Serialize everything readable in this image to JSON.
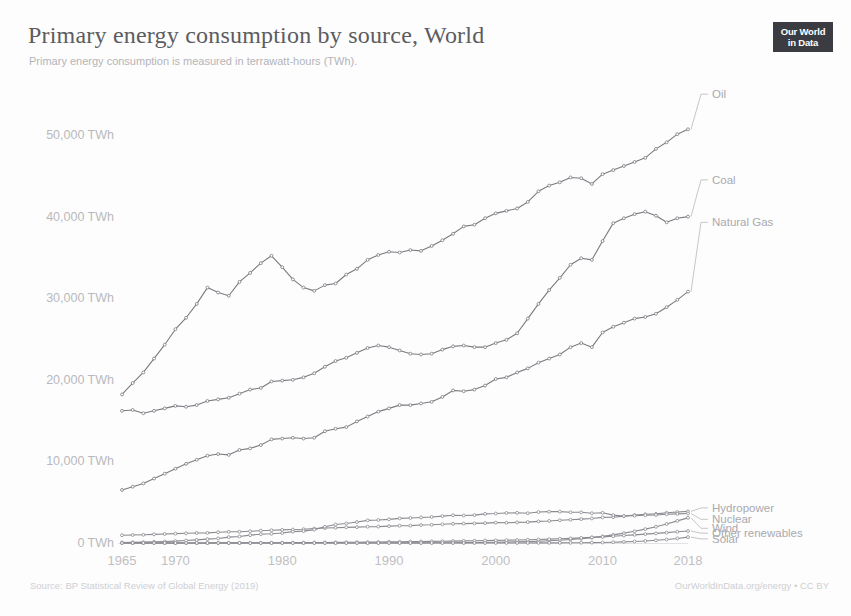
{
  "header": {
    "title": "Primary energy consumption by source, World",
    "subtitle": "Primary energy consumption is measured in terrawatt-hours (TWh).",
    "logo_line1": "Our World",
    "logo_line2": "in Data"
  },
  "footer": {
    "source": "Source: BP Statistical Review of Global Energy (2019)",
    "attribution": "OurWorldInData.org/energy • CC BY"
  },
  "chart_data": {
    "type": "line",
    "title": "Primary energy consumption by source, World",
    "subtitle": "Primary energy consumption is measured in terrawatt-hours (TWh).",
    "xlabel": "",
    "ylabel": "TWh",
    "xlim": [
      1965,
      2018
    ],
    "ylim": [
      0,
      55000
    ],
    "grid": false,
    "legend_position": "right-inline-labels",
    "y_tick_labels": [
      "0 TWh",
      "10,000 TWh",
      "20,000 TWh",
      "30,000 TWh",
      "40,000 TWh",
      "50,000 TWh"
    ],
    "y_tick_values": [
      0,
      10000,
      20000,
      30000,
      40000,
      50000
    ],
    "x_tick_labels": [
      "1965",
      "1970",
      "1980",
      "1990",
      "2000",
      "2010",
      "2018"
    ],
    "x_tick_values": [
      1965,
      1970,
      1980,
      1990,
      2000,
      2010,
      2018
    ],
    "x": [
      1965,
      1966,
      1967,
      1968,
      1969,
      1970,
      1971,
      1972,
      1973,
      1974,
      1975,
      1976,
      1977,
      1978,
      1979,
      1980,
      1981,
      1982,
      1983,
      1984,
      1985,
      1986,
      1987,
      1988,
      1989,
      1990,
      1991,
      1992,
      1993,
      1994,
      1995,
      1996,
      1997,
      1998,
      1999,
      2000,
      2001,
      2002,
      2003,
      2004,
      2005,
      2006,
      2007,
      2008,
      2009,
      2010,
      2011,
      2012,
      2013,
      2014,
      2015,
      2016,
      2017,
      2018
    ],
    "series": [
      {
        "name": "Oil",
        "color": "#7a7a80",
        "label_y_value": 55000,
        "values": [
          18200,
          19600,
          20900,
          22600,
          24300,
          26200,
          27600,
          29300,
          31300,
          30700,
          30300,
          32000,
          33100,
          34300,
          35200,
          33800,
          32300,
          31300,
          30900,
          31600,
          31800,
          32900,
          33600,
          34700,
          35300,
          35700,
          35600,
          35900,
          35800,
          36400,
          37100,
          37900,
          38800,
          39000,
          39800,
          40400,
          40700,
          41000,
          41800,
          43100,
          43800,
          44200,
          44800,
          44700,
          44000,
          45200,
          45700,
          46200,
          46700,
          47200,
          48300,
          49100,
          50100,
          50700
        ]
      },
      {
        "name": "Coal",
        "color": "#7a7a80",
        "label_y_value": 44500,
        "values": [
          16200,
          16300,
          15900,
          16200,
          16500,
          16800,
          16700,
          16900,
          17400,
          17600,
          17800,
          18300,
          18800,
          19000,
          19800,
          19900,
          20000,
          20300,
          20800,
          21600,
          22300,
          22700,
          23300,
          23900,
          24200,
          24000,
          23600,
          23200,
          23100,
          23200,
          23700,
          24100,
          24200,
          24000,
          24000,
          24500,
          24900,
          25700,
          27500,
          29300,
          31000,
          32500,
          34100,
          34900,
          34700,
          37000,
          39200,
          39800,
          40300,
          40600,
          40100,
          39300,
          39800,
          40000
        ]
      },
      {
        "name": "Natural Gas",
        "color": "#7a7a80",
        "label_y_value": 39300,
        "values": [
          6500,
          6900,
          7300,
          7900,
          8500,
          9100,
          9700,
          10200,
          10700,
          10900,
          10800,
          11400,
          11600,
          12000,
          12700,
          12800,
          12900,
          12800,
          12900,
          13700,
          14000,
          14200,
          14900,
          15500,
          16100,
          16500,
          16900,
          16900,
          17100,
          17300,
          17900,
          18700,
          18600,
          18800,
          19300,
          20100,
          20300,
          20900,
          21400,
          22100,
          22600,
          23100,
          24000,
          24500,
          24000,
          25800,
          26500,
          27000,
          27500,
          27700,
          28100,
          28900,
          29800,
          30800
        ]
      },
      {
        "name": "Hydropower",
        "color": "#8a8a90",
        "label_y_value": 4300,
        "values": [
          950,
          980,
          1010,
          1060,
          1100,
          1150,
          1190,
          1230,
          1240,
          1320,
          1370,
          1380,
          1440,
          1510,
          1560,
          1610,
          1650,
          1690,
          1770,
          1830,
          1870,
          1920,
          1950,
          2000,
          2010,
          2070,
          2120,
          2130,
          2200,
          2230,
          2290,
          2350,
          2380,
          2400,
          2440,
          2500,
          2480,
          2530,
          2560,
          2650,
          2700,
          2790,
          2850,
          2930,
          3010,
          3140,
          3160,
          3290,
          3430,
          3520,
          3570,
          3710,
          3790,
          3870
        ]
      },
      {
        "name": "Nuclear",
        "color": "#8a8a90",
        "label_y_value": 2900,
        "values": [
          70,
          90,
          110,
          140,
          180,
          230,
          300,
          380,
          470,
          560,
          720,
          800,
          960,
          1080,
          1130,
          1220,
          1390,
          1460,
          1640,
          1990,
          2270,
          2390,
          2570,
          2770,
          2820,
          2900,
          3020,
          3070,
          3130,
          3190,
          3290,
          3400,
          3370,
          3420,
          3570,
          3610,
          3680,
          3700,
          3650,
          3790,
          3840,
          3850,
          3770,
          3760,
          3650,
          3700,
          3420,
          3300,
          3340,
          3400,
          3440,
          3520,
          3570,
          3620
        ]
      },
      {
        "name": "Wind",
        "color": "#8a8a90",
        "label_y_value": 1800,
        "values": [
          0,
          0,
          0,
          0,
          0,
          0,
          0,
          0,
          0,
          0,
          0,
          0,
          0,
          0,
          0,
          0,
          0,
          0,
          0,
          0,
          0,
          0,
          0,
          0,
          0,
          10,
          10,
          15,
          20,
          25,
          30,
          35,
          45,
          55,
          70,
          90,
          110,
          140,
          170,
          210,
          270,
          330,
          420,
          530,
          660,
          810,
          1000,
          1210,
          1440,
          1700,
          1990,
          2330,
          2710,
          3080
        ]
      },
      {
        "name": "Other renewables",
        "color": "#8a8a90",
        "label_y_value": 1200,
        "values": [
          0,
          0,
          0,
          0,
          0,
          0,
          0,
          5,
          8,
          10,
          14,
          18,
          22,
          26,
          30,
          35,
          42,
          50,
          58,
          66,
          76,
          86,
          96,
          110,
          125,
          140,
          155,
          170,
          185,
          200,
          215,
          235,
          255,
          275,
          295,
          320,
          345,
          370,
          400,
          435,
          475,
          520,
          570,
          625,
          685,
          750,
          830,
          915,
          1000,
          1090,
          1180,
          1270,
          1370,
          1470
        ]
      },
      {
        "name": "Solar",
        "color": "#8a8a90",
        "label_y_value": 500,
        "values": [
          0,
          0,
          0,
          0,
          0,
          0,
          0,
          0,
          0,
          0,
          0,
          0,
          0,
          0,
          0,
          0,
          0,
          0,
          0,
          0,
          0,
          0,
          0,
          0,
          0,
          0,
          0,
          0,
          0,
          0,
          1,
          1,
          2,
          2,
          3,
          4,
          5,
          6,
          8,
          10,
          13,
          17,
          23,
          32,
          45,
          62,
          95,
          140,
          190,
          250,
          330,
          430,
          560,
          720
        ]
      }
    ]
  }
}
